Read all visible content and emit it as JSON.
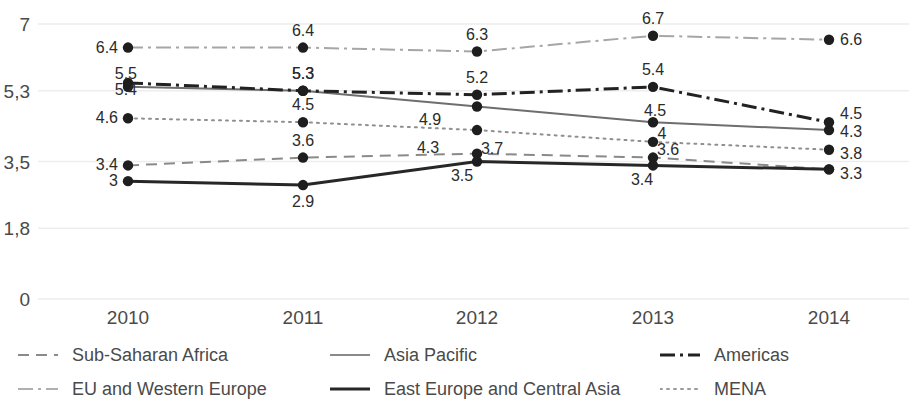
{
  "chart_data": {
    "type": "line",
    "title": "",
    "xlabel": "",
    "ylabel": "",
    "categories": [
      "2010",
      "2011",
      "2012",
      "2013",
      "2014"
    ],
    "x_tick_labels": [
      "2010",
      "2011",
      "2012",
      "2013",
      "2014"
    ],
    "y_tick_labels": [
      "7",
      "5,3",
      "3,5",
      "1,8",
      "0"
    ],
    "y_tick_values": [
      7,
      5.3,
      3.5,
      1.8,
      0
    ],
    "ylim": [
      0,
      7
    ],
    "grid": "horizontal",
    "legend_position": "bottom",
    "series": [
      {
        "name": "Sub-Saharan Africa",
        "style": "dashed",
        "color": "#8a8a8a",
        "width": 2,
        "values": [
          3.4,
          3.6,
          3.7,
          3.6,
          3.3
        ],
        "labels": [
          "3.4",
          "3.6",
          "3.7",
          "3.6",
          "3.3"
        ]
      },
      {
        "name": "Asia Pacific",
        "style": "solid-thin",
        "color": "#6e6e6e",
        "width": 2,
        "values": [
          5.4,
          5.3,
          4.9,
          4.5,
          4.3
        ],
        "labels": [
          "5.4",
          "5.3",
          "4.9",
          "4.5",
          "4.3"
        ]
      },
      {
        "name": "Americas",
        "style": "dash-dot-bold",
        "color": "#222222",
        "width": 3,
        "values": [
          5.5,
          5.3,
          5.2,
          5.4,
          4.5
        ],
        "labels": [
          "5.5",
          "5.3",
          "5.2",
          "5.4",
          "4.5"
        ]
      },
      {
        "name": "EU and Western Europe",
        "style": "dash-dot-light",
        "color": "#a6a6a6",
        "width": 2,
        "values": [
          6.4,
          6.4,
          6.3,
          6.7,
          6.6
        ],
        "labels": [
          "6.4",
          "6.4",
          "6.3",
          "6.7",
          "6.6"
        ]
      },
      {
        "name": "East Europe and Central Asia",
        "style": "solid-bold",
        "color": "#272727",
        "width": 3,
        "values": [
          3.0,
          2.9,
          3.5,
          3.4,
          3.3
        ],
        "labels": [
          "3",
          "2.9",
          "3.5",
          "3.4",
          "3.3"
        ]
      },
      {
        "name": "MENA",
        "style": "dotted",
        "color": "#8f8f8f",
        "width": 2,
        "values": [
          4.6,
          4.5,
          4.3,
          4.0,
          3.8
        ],
        "labels": [
          "4.6",
          "4.5",
          "4.3",
          "4",
          "3.8"
        ]
      }
    ]
  },
  "legend": {
    "items": [
      {
        "label": "Sub-Saharan Africa"
      },
      {
        "label": "Asia Pacific"
      },
      {
        "label": "Americas"
      },
      {
        "label": "EU and Western Europe"
      },
      {
        "label": "East Europe and Central Asia"
      },
      {
        "label": "MENA"
      }
    ]
  },
  "axis": {
    "y_labels": [
      "7",
      "5,3",
      "3,5",
      "1,8",
      "0"
    ],
    "x_labels": [
      "2010",
      "2011",
      "2012",
      "2013",
      "2014"
    ]
  },
  "colors": {
    "background": "#ffffff",
    "gridline": "#ededed",
    "axis_text": "#4a4a4a",
    "label_text": "#2b2b2b",
    "marker": "#1e1e1e"
  }
}
